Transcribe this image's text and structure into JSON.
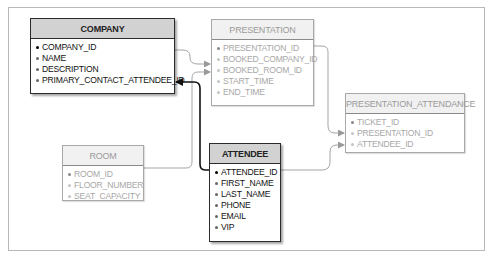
{
  "diagram": {
    "type": "entity-relationship",
    "colors": {
      "highlight_border": "#2b2b2b",
      "highlight_header": "#d2d2d2",
      "faded_border": "#a8a8a8",
      "faded_text": "#a8a8a8",
      "frame": "#b8b8b8"
    },
    "entities": {
      "company": {
        "title": "COMPANY",
        "highlighted": true,
        "fields": [
          "COMPANY_ID",
          "NAME",
          "DESCRIPTION",
          "PRIMARY_CONTACT_ATTENDEE_ID"
        ],
        "primary_key": "COMPANY_ID"
      },
      "presentation": {
        "title": "PRESENTATION",
        "highlighted": false,
        "fields": [
          "PRESENTATION_ID",
          "BOOKED_COMPANY_ID",
          "BOOKED_ROOM_ID",
          "START_TIME",
          "END_TIME"
        ],
        "primary_key": "PRESENTATION_ID"
      },
      "presentation_attendance": {
        "title": "PRESENTATION_ATTENDANCE",
        "highlighted": false,
        "fields": [
          "TICKET_ID",
          "PRESENTATION_ID",
          "ATTENDEE_ID"
        ],
        "primary_key": "TICKET_ID"
      },
      "room": {
        "title": "ROOM",
        "highlighted": false,
        "fields": [
          "ROOM_ID",
          "FLOOR_NUMBER",
          "SEAT_CAPACITY"
        ],
        "primary_key": "ROOM_ID"
      },
      "attendee": {
        "title": "ATTENDEE",
        "highlighted": true,
        "fields": [
          "ATTENDEE_ID",
          "FIRST_NAME",
          "LAST_NAME",
          "PHONE",
          "EMAIL",
          "VIP"
        ],
        "primary_key": "ATTENDEE_ID"
      }
    },
    "relationships": [
      {
        "from": "COMPANY.COMPANY_ID",
        "to": "PRESENTATION.BOOKED_COMPANY_ID",
        "highlighted": false
      },
      {
        "from": "ROOM.ROOM_ID",
        "to": "PRESENTATION.BOOKED_ROOM_ID",
        "highlighted": false
      },
      {
        "from": "PRESENTATION.PRESENTATION_ID",
        "to": "PRESENTATION_ATTENDANCE.PRESENTATION_ID",
        "highlighted": false
      },
      {
        "from": "ATTENDEE.ATTENDEE_ID",
        "to": "PRESENTATION_ATTENDANCE.ATTENDEE_ID",
        "highlighted": false
      },
      {
        "from": "ATTENDEE.ATTENDEE_ID",
        "to": "COMPANY.PRIMARY_CONTACT_ATTENDEE_ID",
        "highlighted": true
      }
    ]
  }
}
